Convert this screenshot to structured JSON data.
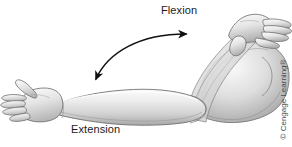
{
  "figure": {
    "background_color": "#ffffff",
    "width": 292,
    "height": 146
  },
  "labels": {
    "flexion": "Flexion",
    "extension": "Extension"
  },
  "credit": {
    "text": "© Cengage Learning®"
  },
  "colors": {
    "skin_light": "#f2f2f2",
    "skin_mid": "#d8d8d8",
    "skin_shadow": "#9b9b9b",
    "skin_dark": "#6e6e6e",
    "outline": "#5c5c5c",
    "arrow": "#111111",
    "label_text": "#1a1a1a",
    "credit_text": "#4a4a4a"
  },
  "arrow": {
    "name": "flexion-extension-double-arrow",
    "start_point": [
      93,
      82
    ],
    "end_point": [
      190,
      32
    ],
    "style": "curved double-headed"
  }
}
